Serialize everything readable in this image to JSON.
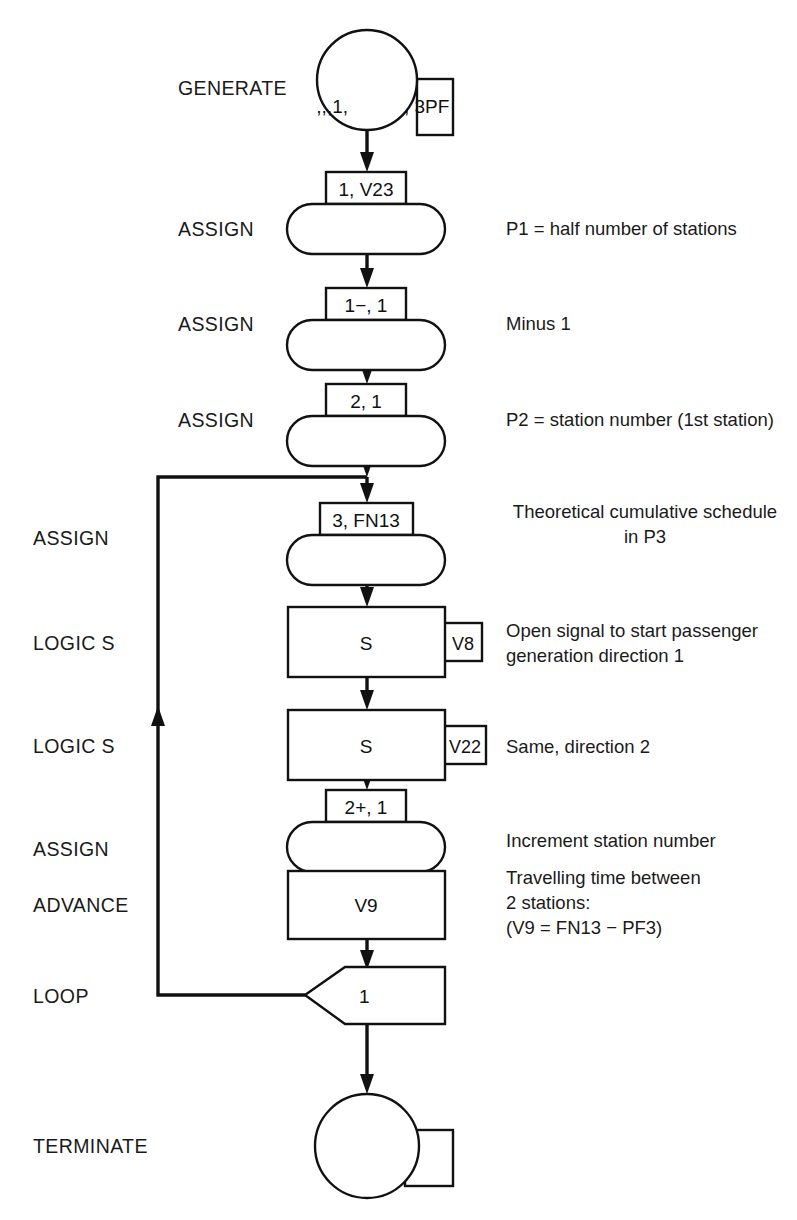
{
  "diagram": {
    "line_color": "#111111",
    "background": "#ffffff"
  },
  "operation_labels": [
    {
      "id": "generate",
      "text": "GENERATE"
    },
    {
      "id": "assign1",
      "text": "ASSIGN"
    },
    {
      "id": "assign2",
      "text": "ASSIGN"
    },
    {
      "id": "assign3",
      "text": "ASSIGN"
    },
    {
      "id": "assign4",
      "text": "ASSIGN"
    },
    {
      "id": "logics1",
      "text": "LOGIC S"
    },
    {
      "id": "logics2",
      "text": "LOGIC S"
    },
    {
      "id": "assign5",
      "text": "ASSIGN"
    },
    {
      "id": "advance",
      "text": "ADVANCE"
    },
    {
      "id": "loop",
      "text": "LOOP"
    },
    {
      "id": "terminate",
      "text": "TERMINATE"
    }
  ],
  "blocks": {
    "generate": {
      "operand_circle": ",,,1,",
      "operand_box": ", 3PF"
    },
    "assign1": {
      "operand": "1, V23"
    },
    "assign2": {
      "operand": "1−, 1"
    },
    "assign3": {
      "operand": "2, 1"
    },
    "assign4": {
      "operand": "3, FN13"
    },
    "logics1": {
      "operand": "S",
      "side_operand": "V8"
    },
    "logics2": {
      "operand": "S",
      "side_operand": "V22"
    },
    "assign5": {
      "operand": "2+, 1"
    },
    "advance": {
      "operand": "V9"
    },
    "loop": {
      "operand": "1"
    },
    "terminate": {
      "operand": "",
      "side_operand": ""
    }
  },
  "annotations": [
    {
      "id": "note-assign1",
      "lines": [
        "P1 = half number of stations"
      ],
      "align": "left"
    },
    {
      "id": "note-assign2",
      "lines": [
        "Minus 1"
      ],
      "align": "left"
    },
    {
      "id": "note-assign3",
      "lines": [
        "P2 = station number (1st station)"
      ],
      "align": "left"
    },
    {
      "id": "note-assign4",
      "lines": [
        "Theoretical cumulative schedule",
        "in P3"
      ],
      "align": "center"
    },
    {
      "id": "note-logics1",
      "lines": [
        "Open signal to start passenger",
        "generation direction 1"
      ],
      "align": "left"
    },
    {
      "id": "note-logics2",
      "lines": [
        "Same, direction 2"
      ],
      "align": "left"
    },
    {
      "id": "note-assign5",
      "lines": [
        "Increment station number"
      ],
      "align": "left"
    },
    {
      "id": "note-advance",
      "lines": [
        "Travelling time between",
        "2 stations:",
        "(V9 = FN13 − PF3)"
      ],
      "align": "left"
    }
  ]
}
